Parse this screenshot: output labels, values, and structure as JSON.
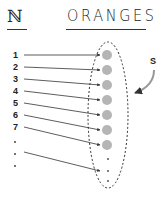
{
  "header": {
    "left_symbol": "ℕ",
    "right_title": "ORANGES"
  },
  "set_label": "S",
  "mapping": [
    {
      "n": "1",
      "y": 55,
      "ty": 55
    },
    {
      "n": "2",
      "y": 67,
      "ty": 70
    },
    {
      "n": "3",
      "y": 79,
      "ty": 85
    },
    {
      "n": "4",
      "y": 91,
      "ty": 100
    },
    {
      "n": "5",
      "y": 103,
      "ty": 115
    },
    {
      "n": "6",
      "y": 115,
      "ty": 130
    },
    {
      "n": "7",
      "y": 127,
      "ty": 145
    }
  ],
  "ellipsis_left": [
    ".",
    ".",
    "."
  ],
  "colors": {
    "orange_dot": "#b5b5b5",
    "line": "#333333"
  }
}
